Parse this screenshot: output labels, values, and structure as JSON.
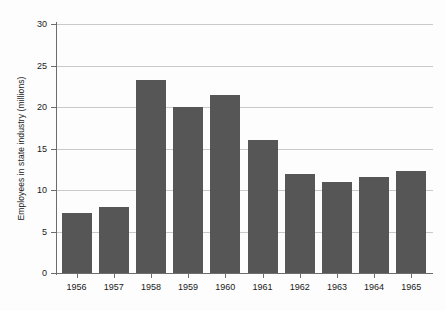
{
  "chart_data": {
    "type": "bar",
    "title": "",
    "subtitle": "",
    "xlabel": "",
    "ylabel": "Employees in state industry (millions)",
    "categories": [
      "1956",
      "1957",
      "1958",
      "1959",
      "1960",
      "1961",
      "1962",
      "1963",
      "1964",
      "1965"
    ],
    "values": [
      7.2,
      8.0,
      23.2,
      20.0,
      21.4,
      16.0,
      11.9,
      11.0,
      11.6,
      12.3
    ],
    "ylim": [
      0,
      30
    ],
    "ytick_labels": [
      "0",
      "5",
      "10",
      "15",
      "20",
      "25",
      "30"
    ],
    "ytick_values": [
      0,
      5,
      10,
      15,
      20,
      25,
      30
    ],
    "grid": "horizontal",
    "legend": "none",
    "bar_color": "#565656",
    "gridline_color": "#c9c9c9",
    "axis_color": "#6d6d6d",
    "background_color": "#fdfdfd",
    "text_color": "#1a1a1a"
  }
}
